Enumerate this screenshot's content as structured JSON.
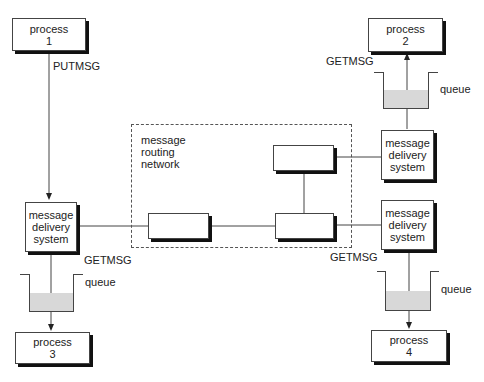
{
  "diagram": {
    "processes": [
      {
        "id": "process-1",
        "line1": "process",
        "line2": "1"
      },
      {
        "id": "process-2",
        "line1": "process",
        "line2": "2"
      },
      {
        "id": "process-3",
        "line1": "process",
        "line2": "3"
      },
      {
        "id": "process-4",
        "line1": "process",
        "line2": "4"
      }
    ],
    "delivery_systems": [
      {
        "line1": "message",
        "line2": "delivery",
        "line3": "system"
      },
      {
        "line1": "message",
        "line2": "delivery",
        "line3": "system"
      },
      {
        "line1": "message",
        "line2": "delivery",
        "line3": "system"
      }
    ],
    "routing_network": {
      "line1": "message",
      "line2": "routing",
      "line3": "network"
    },
    "labels": {
      "putmsg": "PUTMSG",
      "getmsg_left": "GETMSG",
      "getmsg_top_right": "GETMSG",
      "getmsg_bottom_right": "GETMSG",
      "queue_left": "queue",
      "queue_top_right": "queue",
      "queue_bottom_right": "queue"
    },
    "colors": {
      "queue_fill": "#d8d8d8",
      "line": "#444444",
      "shadow": "#111111"
    }
  }
}
